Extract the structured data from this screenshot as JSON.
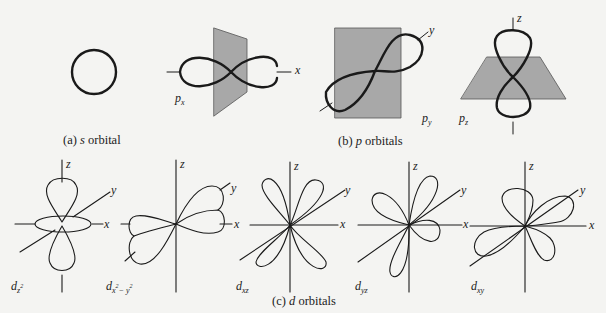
{
  "figure": {
    "panels": [
      {
        "id": "a",
        "caption_prefix": "(a)",
        "caption_italic": "s",
        "caption_rest": "orbital",
        "orbitals": [
          {
            "name": "s",
            "label": ""
          }
        ]
      },
      {
        "id": "b",
        "caption_prefix": "(b)",
        "caption_italic": "p",
        "caption_rest": "orbitals",
        "orbitals": [
          {
            "name": "p_x",
            "label_main": "p",
            "label_sub": "x",
            "axis_label": "x"
          },
          {
            "name": "p_y",
            "label_main": "p",
            "label_sub": "y",
            "axis_label": "y"
          },
          {
            "name": "p_z",
            "label_main": "p",
            "label_sub": "z",
            "axis_label": "z"
          }
        ]
      },
      {
        "id": "c",
        "caption_prefix": "(c)",
        "caption_italic": "d",
        "caption_rest": "orbitals",
        "orbitals": [
          {
            "name": "d_z2",
            "label_main": "d",
            "label_sub": "z",
            "label_sup": "2"
          },
          {
            "name": "d_x2-y2",
            "label_main": "d",
            "label_sub": "x",
            "label_sup": "2",
            "label_sub2": "− y",
            "label_sup2": "2"
          },
          {
            "name": "d_xz",
            "label_main": "d",
            "label_sub": "xz"
          },
          {
            "name": "d_yz",
            "label_main": "d",
            "label_sub": "yz"
          },
          {
            "name": "d_xy",
            "label_main": "d",
            "label_sub": "xy"
          }
        ]
      }
    ],
    "axis_labels": {
      "x": "x",
      "y": "y",
      "z": "z"
    },
    "colors": {
      "background": "#f4f4f2",
      "line": "#1a1a1a",
      "nodal_plane": "#a8a8a8"
    }
  }
}
